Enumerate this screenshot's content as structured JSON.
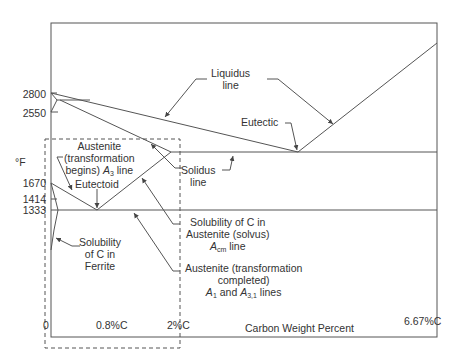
{
  "diagram": {
    "y_axis": {
      "unit_label": "°F",
      "ticks": [
        "2800",
        "2550",
        "1670",
        "1414",
        "1333"
      ]
    },
    "x_axis": {
      "title": "Carbon Weight Percent",
      "ticks": [
        "0",
        "0.8%C",
        "2%C",
        "6.67%C"
      ]
    },
    "labels": {
      "liquidus_1": "Liquidus",
      "liquidus_2": "line",
      "eutectic": "Eutectic",
      "solidus_1": "Solidus",
      "solidus_2": "line",
      "austenite_begins_1": "Austenite",
      "austenite_begins_2": "(transformation",
      "austenite_begins_3a": "begins)",
      "austenite_begins_3b_sym": "A",
      "austenite_begins_3b_sub": "3",
      "austenite_begins_3c": "line",
      "eutectoid": "Eutectoid",
      "solubility_ferrite_1": "Solubility",
      "solubility_ferrite_2": "of C in",
      "solubility_ferrite_3": "Ferrite",
      "solvus_1": "Solubility of C in",
      "solvus_2": "Austenite (solvus)",
      "solvus_3_sym": "A",
      "solvus_3_sub": "cm",
      "solvus_3_rest": "line",
      "completed_1": "Austenite (transformation",
      "completed_2": "completed)",
      "completed_3_sym1": "A",
      "completed_3_sub1": "1",
      "completed_3_mid": "and",
      "completed_3_sym2": "A",
      "completed_3_sub2": "3,1",
      "completed_3_rest": "lines"
    },
    "colors": {
      "line": "#555555",
      "text": "#333333",
      "background": "#ffffff"
    }
  }
}
